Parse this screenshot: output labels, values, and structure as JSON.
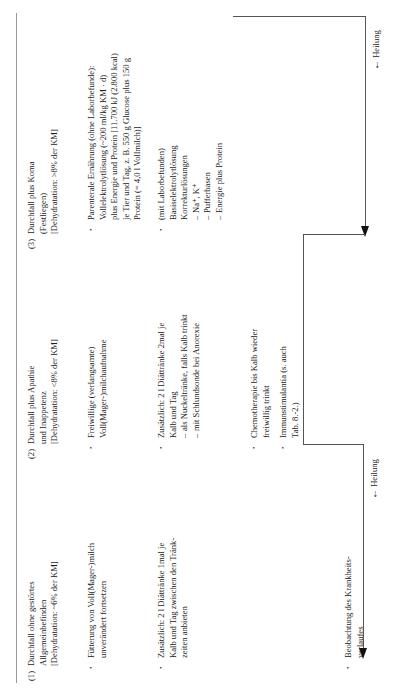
{
  "document": {
    "language": "de",
    "orientation": "rotated-90-ccw",
    "kind": "veterinary-textbook-table"
  },
  "columns": [
    {
      "id": "col-1",
      "number": "(1)",
      "heading_lines": [
        "Durchfall ohne gestörtes",
        "Allgemeinbefinden",
        "[Dehydratation: ~6% der KM]"
      ],
      "bullets": [
        {
          "marker": "•",
          "lines": [
            "Fütterung von Voll(Mager-)milch",
            "unverändert fortsetzen"
          ]
        },
        {
          "marker": "•",
          "lines": [
            "Zusätzlich: 2 l Diättränke 1mal je",
            "Kalb und Tag zwischen den Tränk-",
            "zeiten anbieten"
          ]
        },
        {
          "marker": "•",
          "lines": [
            "Beobachtung des Krankheits-",
            "verlaufes"
          ]
        }
      ]
    },
    {
      "id": "col-2",
      "number": "(2)",
      "heading_lines": [
        "Durchfall plus Apathie",
        "und Inappetenz",
        "[Dehydratation: <8% der KM]"
      ],
      "bullets": [
        {
          "marker": "•",
          "lines": [
            "Freiwillige (verlangsamte)",
            "Voll(Mager-)milchaufnahme"
          ]
        },
        {
          "marker": "•",
          "lines": [
            "Zusätzlich: 2 l Diättränke 2mal je",
            "Kalb und Tag"
          ],
          "subitems": [
            {
              "dash": "–",
              "text": "als Nuckeltränke, falls Kalb trinkt"
            },
            {
              "dash": "–",
              "text": "mit Schlundsonde bei Anorexie"
            }
          ]
        },
        {
          "marker": "•",
          "lines": [
            "Chemotherapie bis Kalb wieder",
            "freiwillig trinkt"
          ]
        },
        {
          "marker": "•",
          "lines": [
            "Immunstimulantia (s. auch",
            "Tab. 8.-2.)"
          ]
        }
      ]
    },
    {
      "id": "col-3",
      "number": "(3)",
      "heading_lines": [
        "Durchfall plus Koma",
        "(Festliegen)",
        "[Dehydratation: >8% der KM]"
      ],
      "bullets": [
        {
          "marker": "•",
          "lines": [
            "Parenterale Ernährung (ohne Laborbefunde):",
            "Vollelektrolytlösung (~200 ml/kg KM · d)",
            "plus Energie und Protein [11.700 kJ (2.800 kcal)",
            "je Tier und Tag, z. B. 550 g Glucose plus 150 g",
            "Protein (= 4,0 l Vollmilch)]"
          ]
        },
        {
          "marker": "•",
          "lines": [
            "(mit Laborbefunden)",
            "Basiselektrolytlösung",
            "Korrekturlösungen"
          ],
          "subitems": [
            {
              "dash": "–",
              "text": "Na⁺, K⁺"
            },
            {
              "dash": "–",
              "text": "Pufferbasen"
            },
            {
              "dash": "–",
              "text": "Energie plus Protein"
            }
          ]
        }
      ]
    }
  ],
  "flow": {
    "labels": [
      {
        "id": "heilung-1",
        "arrow": "←",
        "text": "Heilung"
      },
      {
        "id": "heilung-2",
        "arrow": "←",
        "text": "Heilung"
      }
    ]
  },
  "colors": {
    "text": "#1a1a1a",
    "rule": "#9a9a9a",
    "flow_line": "#555555",
    "arrow_head": "#111111",
    "page_background": "#ffffff"
  }
}
